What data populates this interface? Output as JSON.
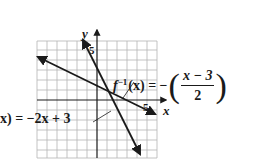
{
  "figure": {
    "type": "graph of function and its inverse",
    "grid": {
      "x_min": -6,
      "x_max": 6,
      "y_min": -6,
      "y_max": 6,
      "step": 1
    },
    "axes": {
      "x_label": "x",
      "y_label": "y",
      "x_tick_label": "5",
      "y_tick_label": "5"
    },
    "curves": [
      {
        "name": "f",
        "label_prefix": "f(x) = ",
        "label_visible": "x) = −2x + 3",
        "expression": "-2x + 3",
        "points": [
          [
            -1.5,
            6
          ],
          [
            4.5,
            -6
          ]
        ]
      },
      {
        "name": "f_inverse",
        "label_lhs": "f",
        "label_sup": "−1",
        "label_arg": "(x) = −",
        "label_num": "x − 3",
        "label_den": "2",
        "expression": "-(x - 3)/2",
        "points": [
          [
            -5.5,
            4.25
          ],
          [
            5.5,
            -1.25
          ]
        ]
      }
    ],
    "intersection": [
      1,
      1
    ]
  },
  "colors": {
    "ink": "#1a1a1a",
    "grid": "#b0b0b0",
    "background": "#ffffff"
  }
}
